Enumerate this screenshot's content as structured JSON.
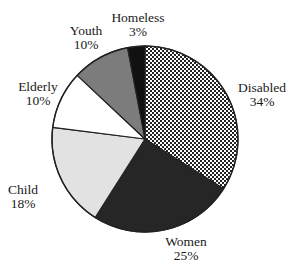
{
  "chart_data": {
    "type": "pie",
    "title": "",
    "start_angle_deg": 0,
    "direction": "clockwise",
    "center": [
      145,
      139
    ],
    "radius": 93,
    "slices": [
      {
        "label": "Disabled",
        "value": 34,
        "percent_label": "34%",
        "fill": "pattern-dots",
        "label_pos": [
          262,
          92
        ]
      },
      {
        "label": "Women",
        "value": 25,
        "percent_label": "25%",
        "fill": "#262626",
        "label_pos": [
          186,
          246
        ]
      },
      {
        "label": "Child",
        "value": 18,
        "percent_label": "18%",
        "fill": "#e2e2e2",
        "label_pos": [
          23,
          194
        ]
      },
      {
        "label": "Elderly",
        "value": 10,
        "percent_label": "10%",
        "fill": "#ffffff",
        "label_pos": [
          38,
          91
        ]
      },
      {
        "label": "Youth",
        "value": 10,
        "percent_label": "10%",
        "fill": "#7c7c7c",
        "label_pos": [
          86,
          35
        ]
      },
      {
        "label": "Homeless",
        "value": 3,
        "percent_label": "3%",
        "fill": "#111111",
        "label_pos": [
          138,
          22
        ]
      }
    ],
    "categories": [
      "Disabled",
      "Women",
      "Child",
      "Elderly",
      "Youth",
      "Homeless"
    ],
    "values": [
      34,
      25,
      18,
      10,
      10,
      3
    ],
    "legend": "none (direct labels)",
    "outline_color": "#222222"
  }
}
